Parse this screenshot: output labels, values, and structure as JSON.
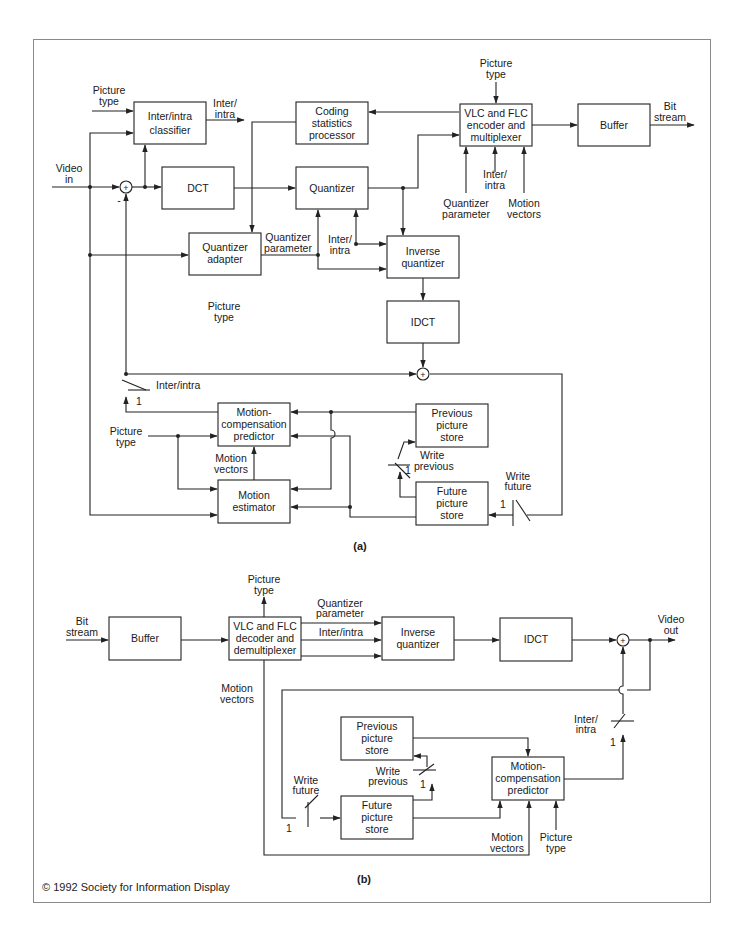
{
  "figure": {
    "copyright": "© 1992 Society for Information Display",
    "caption_a": "(a)",
    "caption_b": "(b)"
  },
  "encoder": {
    "blocks": {
      "classifier": [
        "Inter/intra",
        "classifier"
      ],
      "coding_stats": [
        "Coding",
        "statistics",
        "processor"
      ],
      "vlc_encoder": [
        "VLC and FLC",
        "encoder and",
        "multiplexer"
      ],
      "buffer": [
        "Buffer"
      ],
      "dct": [
        "DCT"
      ],
      "quantizer": [
        "Quantizer"
      ],
      "quantizer_adapter": [
        "Quantizer",
        "adapter"
      ],
      "inverse_quantizer": [
        "Inverse",
        "quantizer"
      ],
      "idct": [
        "IDCT"
      ],
      "mc_predictor": [
        "Motion-",
        "compensation",
        "predictor"
      ],
      "motion_estimator": [
        "Motion",
        "estimator"
      ],
      "previous_store": [
        "Previous",
        "picture",
        "store"
      ],
      "future_store": [
        "Future",
        "picture",
        "store"
      ]
    },
    "labels": {
      "picture_type_classifier": [
        "Picture",
        "type"
      ],
      "inter_intra_out": [
        "Inter/",
        "intra"
      ],
      "picture_type_vlc": [
        "Picture",
        "type"
      ],
      "bit_stream_out": [
        "Bit",
        "stream"
      ],
      "video_in": [
        "Video",
        "in"
      ],
      "minus_sign": "-",
      "plus_sign": "+",
      "vlc_inter_intra": [
        "Inter/",
        "intra"
      ],
      "vlc_quantizer_param": [
        "Quantizer",
        "parameter"
      ],
      "vlc_motion_vectors": [
        "Motion",
        "vectors"
      ],
      "qa_quantizer_param": [
        "Quantizer",
        "parameter"
      ],
      "iq_inter_intra": [
        "Inter/",
        "intra"
      ],
      "qa_picture_type": [
        "Picture",
        "type"
      ],
      "switch_inter_intra": "Inter/intra",
      "switch_1": "1",
      "mc_picture_type": [
        "Picture",
        "type"
      ],
      "motion_vectors": [
        "Motion",
        "vectors"
      ],
      "write_previous": [
        "Write",
        "previous"
      ],
      "write_previous_1": "1",
      "write_future": [
        "Write",
        "future"
      ],
      "write_future_1": "1"
    }
  },
  "decoder": {
    "blocks": {
      "buffer": [
        "Buffer"
      ],
      "vlc_decoder": [
        "VLC and FLC",
        "decoder and",
        "demultiplexer"
      ],
      "inverse_quantizer": [
        "Inverse",
        "quantizer"
      ],
      "idct": [
        "IDCT"
      ],
      "previous_store": [
        "Previous",
        "picture",
        "store"
      ],
      "future_store": [
        "Future",
        "picture",
        "store"
      ],
      "mc_predictor": [
        "Motion-",
        "compensation",
        "predictor"
      ]
    },
    "labels": {
      "bit_stream_in": [
        "Bit",
        "stream"
      ],
      "picture_type_out": [
        "Picture",
        "type"
      ],
      "quantizer_param": [
        "Quantizer",
        "parameter"
      ],
      "inter_intra": "Inter/intra",
      "video_out": [
        "Video",
        "out"
      ],
      "motion_vectors_left": [
        "Motion",
        "vectors"
      ],
      "switch_inter_intra": [
        "Inter/",
        "intra"
      ],
      "switch_1": "1",
      "write_previous": [
        "Write",
        "previous"
      ],
      "write_previous_1": "1",
      "write_future": [
        "Write",
        "future"
      ],
      "write_future_1": "1",
      "mc_motion_vectors": [
        "Motion",
        "vectors"
      ],
      "mc_picture_type": [
        "Picture",
        "type"
      ],
      "plus_sign": "+"
    }
  }
}
